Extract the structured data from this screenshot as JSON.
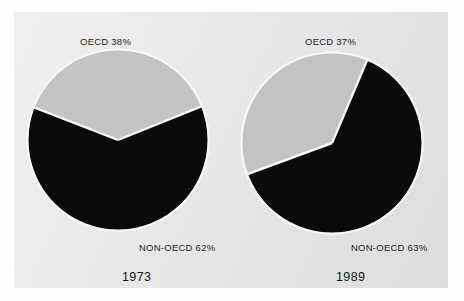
{
  "figure": {
    "background_color": "#ffffff",
    "panel_color": "#e9e9e9",
    "slice_gray_color": "#c4c4c4",
    "slice_black_color": "#0a0a0a",
    "separator_color": "#f5f5f5"
  },
  "chart_data": [
    {
      "type": "pie",
      "title": "1973",
      "labels": [
        "OECD",
        "NON-OECD"
      ],
      "values": [
        38,
        62
      ],
      "value_unit": "%",
      "data_labels": [
        "OECD 38%",
        "NON-OECD 62%"
      ],
      "colors": [
        "#c4c4c4",
        "#0a0a0a"
      ],
      "legend": "none",
      "start_angle_deg": 22,
      "direction": "counterclockwise",
      "center_px": [
        118,
        140
      ],
      "radius_px": 90
    },
    {
      "type": "pie",
      "title": "1989",
      "labels": [
        "OECD",
        "NON-OECD"
      ],
      "values": [
        37,
        63
      ],
      "value_unit": "%",
      "data_labels": [
        "OECD 37%",
        "NON-OECD 63%"
      ],
      "colors": [
        "#c4c4c4",
        "#0a0a0a"
      ],
      "legend": "none",
      "start_angle_deg": 67,
      "direction": "counterclockwise",
      "center_px": [
        332,
        143
      ],
      "radius_px": 90
    }
  ],
  "charts": [
    {
      "id": "chart-1973",
      "year_label": "1973",
      "oecd_label": "OECD 38%",
      "nonoecd_label": "NON-OECD 62%"
    },
    {
      "id": "chart-1989",
      "year_label": "1989",
      "oecd_label": "OECD 37%",
      "nonoecd_label": "NON-OECD 63%"
    }
  ]
}
